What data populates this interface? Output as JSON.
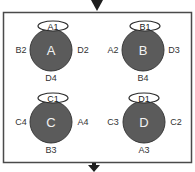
{
  "diagram": {
    "colors": {
      "circle_fill": "#5b5b5b",
      "circle_stroke": "#3a3a3a",
      "frame": "#444444",
      "arrow": "#222222",
      "label": "#333333"
    },
    "nodes": [
      {
        "id": "A",
        "center_label": "A",
        "top_label": "A1",
        "left_label": "B2",
        "right_label": "D2",
        "bottom_label": "D4"
      },
      {
        "id": "B",
        "center_label": "B",
        "top_label": "B1",
        "left_label": "A2",
        "right_label": "D3",
        "bottom_label": "B4"
      },
      {
        "id": "C",
        "center_label": "C",
        "top_label": "C1",
        "left_label": "C4",
        "right_label": "A4",
        "bottom_label": "B3"
      },
      {
        "id": "D",
        "center_label": "D",
        "top_label": "D1",
        "left_label": "C3",
        "right_label": "C2",
        "bottom_label": "A3"
      }
    ],
    "arrows": {
      "input": "down-arrow-top",
      "output": "down-arrow-bottom"
    }
  }
}
